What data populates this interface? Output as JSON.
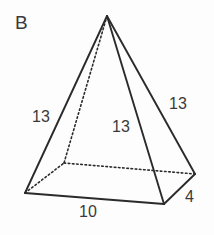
{
  "figure": {
    "id_label": "B",
    "type": "rectangular-pyramid-net-diagram",
    "background_color": "#fdfdfd",
    "stroke_color": "#2b2b2b",
    "text_color": "#3a3a3a"
  },
  "labels": {
    "left_slant_edge": "13",
    "front_slant_edge": "13",
    "right_slant_edge": "13",
    "base_front_edge": "10",
    "base_side_edge": "4"
  },
  "geometry": {
    "apex": {
      "x": 107,
      "y": 16
    },
    "base_left": {
      "x": 25,
      "y": 193
    },
    "base_back": {
      "x": 64,
      "y": 163
    },
    "base_right": {
      "x": 195,
      "y": 174
    },
    "base_front": {
      "x": 164,
      "y": 204
    },
    "solid_edges": [
      "apex-base_left",
      "apex-base_front",
      "apex-base_right",
      "base_left-base_front",
      "base_front-base_right"
    ],
    "dashed_edges": [
      "apex-base_back",
      "base_left-base_back",
      "base_back-base_right"
    ]
  }
}
